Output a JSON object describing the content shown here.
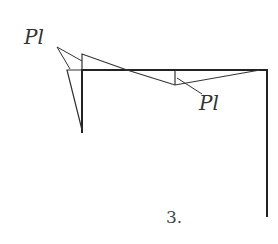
{
  "diagram": {
    "type": "bending-moment-diagram",
    "label_left": "Pl",
    "label_right": "Pl",
    "figure_number": "3.",
    "colors": {
      "frame": "#222222",
      "diagram": "#333333",
      "text": "#333333"
    },
    "frame": {
      "left_column": {
        "x": 82,
        "y_top": 70,
        "y_bottom": 133
      },
      "beam": {
        "y": 70,
        "x_left": 82,
        "x_right": 267
      },
      "right_column": {
        "x": 267,
        "y_top": 70,
        "y_bottom": 217
      }
    },
    "moment_regions": [
      {
        "name": "left-column-triangle",
        "points": [
          [
            67,
            70
          ],
          [
            82,
            70
          ],
          [
            82,
            130
          ]
        ]
      },
      {
        "name": "upper-beam-triangle",
        "points": [
          [
            82,
            54
          ],
          [
            82,
            70
          ],
          [
            127,
            70
          ]
        ]
      },
      {
        "name": "lower-beam-triangle",
        "points": [
          [
            127,
            70
          ],
          [
            175,
            85
          ],
          [
            260,
            70
          ]
        ]
      }
    ]
  }
}
